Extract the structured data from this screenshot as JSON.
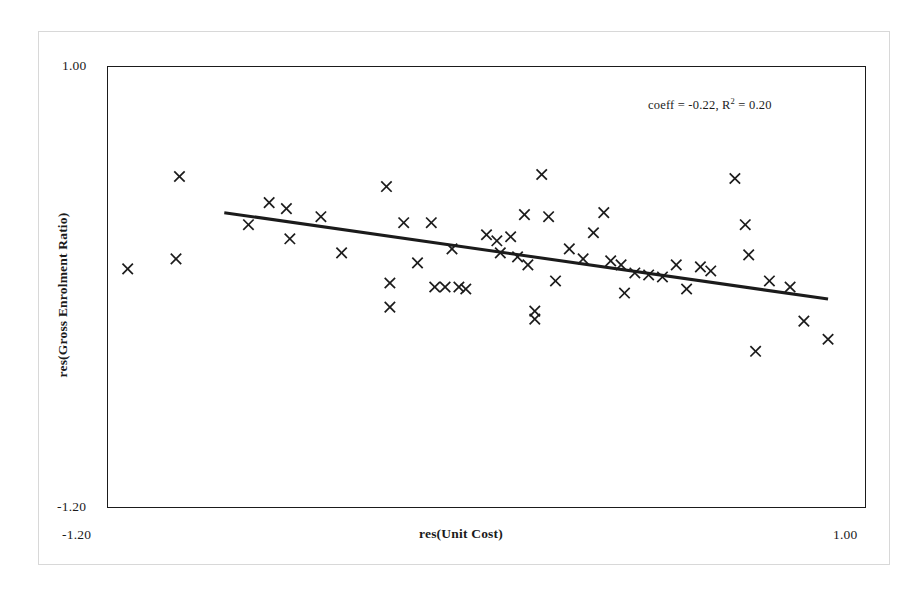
{
  "chart_data": {
    "type": "scatter",
    "title": "",
    "xlabel": "res(Unit Cost)",
    "ylabel": "res(Gross Enrolment Ratio)",
    "xlim": [
      -1.2,
      1.0
    ],
    "ylim": [
      -1.2,
      1.0
    ],
    "xticks": [
      "-1.20",
      "1.00"
    ],
    "yticks": [
      "1.00",
      "-1.20"
    ],
    "grid": false,
    "legend": null,
    "annotation": "coeff = -0.22, R",
    "annotation_sup": "2",
    "annotation_tail": " = 0.20",
    "annotation_full": "coeff = -0.22, R2 = 0.20",
    "coeff": -0.22,
    "r_squared": 0.2,
    "marker_style": "x",
    "marker_color": "#1b1b1b",
    "trendline_color": "#1b1b1b",
    "trendline": {
      "x_start": -0.86,
      "y_start": 0.27,
      "x_end": 0.89,
      "y_end": -0.16
    },
    "points": [
      {
        "x": -1.14,
        "y": -0.01
      },
      {
        "x": -1.0,
        "y": 0.04
      },
      {
        "x": -0.99,
        "y": 0.45
      },
      {
        "x": -0.79,
        "y": 0.21
      },
      {
        "x": -0.73,
        "y": 0.32
      },
      {
        "x": -0.68,
        "y": 0.29
      },
      {
        "x": -0.67,
        "y": 0.14
      },
      {
        "x": -0.58,
        "y": 0.25
      },
      {
        "x": -0.52,
        "y": 0.07
      },
      {
        "x": -0.39,
        "y": 0.4
      },
      {
        "x": -0.38,
        "y": -0.08
      },
      {
        "x": -0.38,
        "y": -0.2
      },
      {
        "x": -0.34,
        "y": 0.22
      },
      {
        "x": -0.3,
        "y": 0.02
      },
      {
        "x": -0.26,
        "y": 0.22
      },
      {
        "x": -0.25,
        "y": -0.1
      },
      {
        "x": -0.22,
        "y": -0.1
      },
      {
        "x": -0.2,
        "y": 0.09
      },
      {
        "x": -0.18,
        "y": -0.1
      },
      {
        "x": -0.16,
        "y": -0.11
      },
      {
        "x": -0.1,
        "y": 0.16
      },
      {
        "x": -0.07,
        "y": 0.13
      },
      {
        "x": -0.06,
        "y": 0.07
      },
      {
        "x": -0.03,
        "y": 0.15
      },
      {
        "x": -0.01,
        "y": 0.05
      },
      {
        "x": 0.01,
        "y": 0.26
      },
      {
        "x": 0.02,
        "y": 0.01
      },
      {
        "x": 0.04,
        "y": -0.22
      },
      {
        "x": 0.04,
        "y": -0.26
      },
      {
        "x": 0.06,
        "y": 0.46
      },
      {
        "x": 0.08,
        "y": 0.25
      },
      {
        "x": 0.1,
        "y": -0.07
      },
      {
        "x": 0.14,
        "y": 0.09
      },
      {
        "x": 0.18,
        "y": 0.04
      },
      {
        "x": 0.21,
        "y": 0.17
      },
      {
        "x": 0.24,
        "y": 0.27
      },
      {
        "x": 0.26,
        "y": 0.03
      },
      {
        "x": 0.29,
        "y": 0.01
      },
      {
        "x": 0.3,
        "y": -0.13
      },
      {
        "x": 0.33,
        "y": -0.03
      },
      {
        "x": 0.37,
        "y": -0.04
      },
      {
        "x": 0.41,
        "y": -0.05
      },
      {
        "x": 0.45,
        "y": 0.01
      },
      {
        "x": 0.48,
        "y": -0.11
      },
      {
        "x": 0.52,
        "y": 0.0
      },
      {
        "x": 0.55,
        "y": -0.02
      },
      {
        "x": 0.62,
        "y": 0.44
      },
      {
        "x": 0.65,
        "y": 0.21
      },
      {
        "x": 0.66,
        "y": 0.06
      },
      {
        "x": 0.68,
        "y": -0.42
      },
      {
        "x": 0.72,
        "y": -0.07
      },
      {
        "x": 0.78,
        "y": -0.1
      },
      {
        "x": 0.82,
        "y": -0.27
      },
      {
        "x": 0.89,
        "y": -0.36
      }
    ]
  }
}
